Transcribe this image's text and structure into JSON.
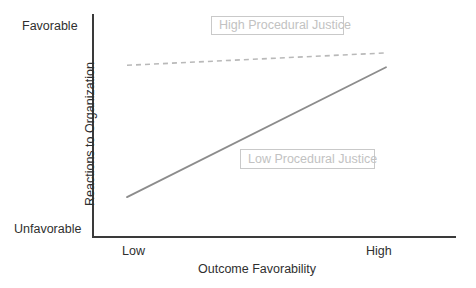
{
  "chart_data": {
    "type": "line",
    "title": "",
    "xlabel": "Outcome Favorability",
    "ylabel": "Reactions to Organization",
    "x_tick_labels": [
      "Low",
      "High"
    ],
    "y_tick_labels": [
      "Unfavorable",
      "Favorable"
    ],
    "xlim": [
      "Low",
      "High"
    ],
    "ylim": [
      "Unfavorable",
      "Favorable"
    ],
    "grid": false,
    "legend_position": "inline-annotations",
    "series": [
      {
        "name": "High Procedural Justice",
        "style": "dashed",
        "color": "#b9b9b9",
        "x": [
          "Low",
          "High"
        ],
        "values": [
          0.79,
          0.85
        ]
      },
      {
        "name": "Low Procedural Justice",
        "style": "solid",
        "color": "#8c8c8c",
        "x": [
          "Low",
          "High"
        ],
        "values": [
          0.15,
          0.78
        ]
      }
    ],
    "annotations": [
      {
        "label": "High Procedural Justice"
      },
      {
        "label": "Low Procedural Justice"
      }
    ]
  },
  "axes": {
    "y_high_label": "Favorable",
    "y_low_label": "Unfavorable",
    "y_title": "Reactions to Organization",
    "x_low_label": "Low",
    "x_high_label": "High",
    "x_title": "Outcome Favorability"
  },
  "annotations": {
    "high_justice": "High Procedural Justice",
    "low_justice": "Low Procedural Justice"
  },
  "colors": {
    "axis": "#3a3a3a",
    "text": "#2f2f2f",
    "annotation_text": "#c2c2c2",
    "annotation_border": "#c9c9c9",
    "line_solid": "#8c8c8c",
    "line_dashed": "#b9b9b9",
    "background": "#ffffff"
  }
}
